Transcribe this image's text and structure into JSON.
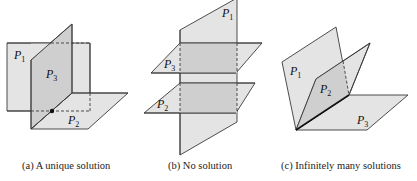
{
  "figure": {
    "panels": [
      {
        "id": "a",
        "caption": "(a) A unique solution",
        "labels": [
          {
            "name": "P",
            "sub": "1"
          },
          {
            "name": "P",
            "sub": "3"
          },
          {
            "name": "P",
            "sub": "2"
          }
        ]
      },
      {
        "id": "b",
        "caption": "(b) No solution",
        "labels": [
          {
            "name": "P",
            "sub": "1"
          },
          {
            "name": "P",
            "sub": "3"
          },
          {
            "name": "P",
            "sub": "2"
          }
        ]
      },
      {
        "id": "c",
        "caption": "(c) Infinitely many solutions",
        "labels": [
          {
            "name": "P",
            "sub": "1"
          },
          {
            "name": "P",
            "sub": "2"
          },
          {
            "name": "P",
            "sub": "3"
          }
        ]
      }
    ],
    "colors": {
      "plane_fill": "#e4e4e4",
      "overlap_fill": "#cfcfcf",
      "stroke": "#3a3a3a"
    }
  }
}
